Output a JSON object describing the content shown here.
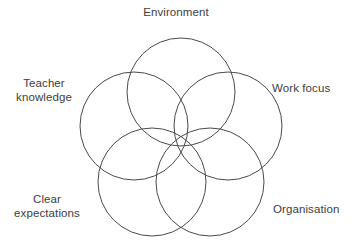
{
  "figure": {
    "kind": "five-circle-overlap-diagram",
    "background_color": "#ffffff",
    "stroke_color": "#4a4a4a",
    "text_color": "#3d3d3d"
  },
  "labels": {
    "top": "Environment",
    "left": "Teacher\nknowledge",
    "right": "Work focus",
    "bottom_left": "Clear\nexpectations",
    "bottom_right": "Organisation"
  },
  "chart_data": {
    "type": "diagram",
    "title": "",
    "subtype": "five-set-venn",
    "sets": [
      {
        "name": "Environment",
        "position": "top",
        "cx": 181,
        "cy": 92,
        "r": 54
      },
      {
        "name": "Work focus",
        "position": "right",
        "cx": 228,
        "cy": 126,
        "r": 54
      },
      {
        "name": "Organisation",
        "position": "bottom-right",
        "cx": 210,
        "cy": 182,
        "r": 54
      },
      {
        "name": "Clear expectations",
        "position": "bottom-left",
        "cx": 152,
        "cy": 182,
        "r": 54
      },
      {
        "name": "Teacher knowledge",
        "position": "left",
        "cx": 134,
        "cy": 126,
        "r": 54
      }
    ],
    "center": {
      "x": 181,
      "y": 133
    },
    "ring_radius": 45,
    "circle_radius": 54,
    "grid": false,
    "legend": "none"
  }
}
